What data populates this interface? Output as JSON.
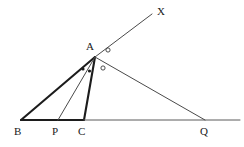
{
  "figure": {
    "type": "euclidean-geometry-diagram",
    "background_color": "#ffffff",
    "stroke_color": "#3a3a3a",
    "thick_stroke_color": "#1c1c1c",
    "label_color": "#1a1a1a",
    "width": 244,
    "height": 147
  },
  "labels": {
    "a": "A",
    "b": "B",
    "c": "C",
    "p": "P",
    "q": "Q",
    "x": "X"
  },
  "points": {
    "A": {
      "x": 95,
      "y": 57,
      "label": "A",
      "label_x": 86,
      "label_y": 41
    },
    "B": {
      "x": 21,
      "y": 120,
      "label": "B",
      "label_x": 14,
      "label_y": 126
    },
    "P": {
      "x": 58,
      "y": 120,
      "label": "P",
      "label_x": 52,
      "label_y": 126
    },
    "C": {
      "x": 84,
      "y": 120,
      "label": "C",
      "label_x": 78,
      "label_y": 126
    },
    "Q": {
      "x": 205,
      "y": 120,
      "label": "Q",
      "label_x": 200,
      "label_y": 126
    },
    "X": {
      "x": 152,
      "y": 14,
      "label": "X",
      "label_x": 157,
      "label_y": 6
    },
    "baseline_end": {
      "x": 240,
      "y": 120
    }
  },
  "segments": [
    {
      "name": "segment-AB",
      "from": "A",
      "to": "B",
      "weight": "thick"
    },
    {
      "name": "segment-AC",
      "from": "A",
      "to": "C",
      "weight": "thick"
    },
    {
      "name": "segment-BC",
      "from": "B",
      "to": "C",
      "weight": "thick"
    },
    {
      "name": "segment-AP",
      "from": "A",
      "to": "P",
      "weight": "thin"
    },
    {
      "name": "segment-AQ",
      "from": "A",
      "to": "Q",
      "weight": "thin"
    },
    {
      "name": "ray-AX",
      "from": "A",
      "to": "X",
      "weight": "thin"
    },
    {
      "name": "baseline-CQ",
      "from": "C",
      "to": "baseline_end",
      "weight": "thin"
    }
  ],
  "angle_markers": [
    {
      "name": "angle-dot-BAP",
      "style": "filled-dot",
      "x": 83,
      "y": 69,
      "r": 1.6
    },
    {
      "name": "angle-dot-PAC",
      "style": "filled-dot",
      "x": 89.5,
      "y": 71,
      "r": 1.6
    },
    {
      "name": "angle-circle-CAQ",
      "style": "open-circle",
      "x": 103,
      "y": 68,
      "r": 2.1
    },
    {
      "name": "angle-circle-QAX",
      "style": "open-circle",
      "x": 108,
      "y": 50,
      "r": 2.1
    }
  ]
}
